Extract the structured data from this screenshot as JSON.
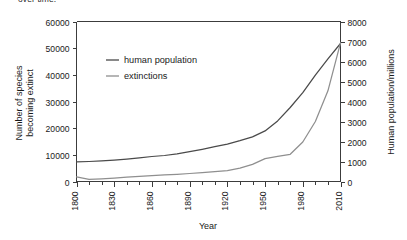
{
  "caption": {
    "clipped_text": "over time."
  },
  "chart_data": {
    "type": "line",
    "title": "",
    "xlabel": "Year",
    "ylabel": "Number of species becoming extinct",
    "y2label": "Human population/millions",
    "xlim": [
      1800,
      2010
    ],
    "ylim": [
      0,
      60000
    ],
    "y2lim": [
      0,
      8000
    ],
    "grid": false,
    "legend_position": "upper-left-inside",
    "x_major_ticks": [
      1800,
      1830,
      1860,
      1890,
      1920,
      1950,
      1980,
      2010
    ],
    "x_major_tick_labels": [
      "1800",
      "1830",
      "1860",
      "1890",
      "1920",
      "1950",
      "1980",
      "2010"
    ],
    "x_minor_tick_interval": 10,
    "y_ticks": [
      0,
      10000,
      20000,
      30000,
      40000,
      50000,
      60000
    ],
    "y_tick_labels": [
      "0",
      "10000",
      "20000",
      "30000",
      "40000",
      "50000",
      "60000"
    ],
    "y2_ticks": [
      0,
      1000,
      2000,
      3000,
      4000,
      5000,
      6000,
      7000,
      8000
    ],
    "y2_tick_labels": [
      "0",
      "1000",
      "2000",
      "3000",
      "4000",
      "5000",
      "6000",
      "7000",
      "8000"
    ],
    "series": [
      {
        "name": "human population",
        "axis": "right",
        "units": "millions",
        "color": "#4a4a4a",
        "x": [
          1800,
          1810,
          1820,
          1830,
          1840,
          1850,
          1860,
          1870,
          1880,
          1890,
          1900,
          1910,
          1920,
          1930,
          1940,
          1950,
          1960,
          1970,
          1980,
          1990,
          2000,
          2010
        ],
        "values": [
          980,
          1000,
          1030,
          1070,
          1120,
          1180,
          1250,
          1300,
          1380,
          1490,
          1610,
          1740,
          1870,
          2040,
          2230,
          2530,
          3030,
          3700,
          4440,
          5320,
          6130,
          6900
        ]
      },
      {
        "name": "extinctions",
        "axis": "left",
        "units": "species",
        "color": "#8f8f8f",
        "x": [
          1800,
          1810,
          1820,
          1830,
          1840,
          1850,
          1860,
          1870,
          1880,
          1890,
          1900,
          1910,
          1920,
          1930,
          1940,
          1950,
          1960,
          1970,
          1980,
          1990,
          2000,
          2010
        ],
        "values": [
          1700,
          800,
          1000,
          1300,
          1600,
          1900,
          2200,
          2500,
          2700,
          3000,
          3300,
          3700,
          4100,
          5000,
          6400,
          8600,
          9400,
          10200,
          14800,
          22500,
          34000,
          52000
        ]
      }
    ],
    "legend_entries": [
      {
        "label": "human population",
        "color": "#4a4a4a"
      },
      {
        "label": "extinctions",
        "color": "#8f8f8f"
      }
    ]
  }
}
